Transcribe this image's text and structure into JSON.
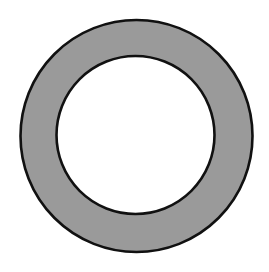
{
  "diagram": {
    "type": "annulus",
    "canvas": {
      "width": 269,
      "height": 272,
      "background": "#ffffff"
    },
    "outer_circle": {
      "cx": 136.5,
      "cy": 136,
      "r": 116,
      "fill": "#9a9a9a",
      "stroke": "#111111",
      "stroke_width": 2.6
    },
    "inner_circle": {
      "cx": 135.5,
      "cy": 135,
      "r": 79,
      "fill": "#ffffff",
      "stroke": "#111111",
      "stroke_width": 2.6
    }
  }
}
